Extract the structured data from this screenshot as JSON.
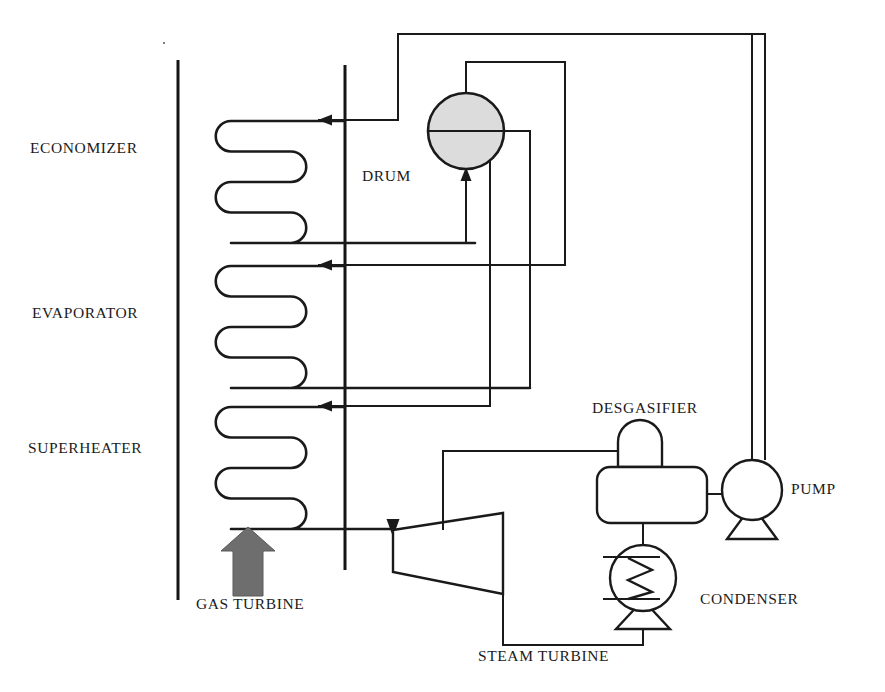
{
  "diagram": {
    "type": "process-flow-schematic",
    "canvas": {
      "width": 885,
      "height": 692
    },
    "colors": {
      "line": "#1a1a1a",
      "drum_fill": "#dcdcdc",
      "gas_arrow": "#6e6e6e",
      "background": "#ffffff",
      "text": "#1b1b1b"
    }
  },
  "labels": {
    "economizer": "ECONOMIZER",
    "evaporator": "EVAPORATOR",
    "superheater": "SUPERHEATER",
    "drum": "DRUM",
    "desgasifier": "DESGASIFIER",
    "pump": "PUMP",
    "condenser": "CONDENSER",
    "gas_turbine": "GAS TURBINE",
    "steam_turbine": "STEAM TURBINE"
  },
  "label_positions": {
    "economizer": {
      "x": 30,
      "y": 147
    },
    "evaporator": {
      "x": 32,
      "y": 305
    },
    "superheater": {
      "x": 28,
      "y": 440
    },
    "drum": {
      "x": 362,
      "y": 168
    },
    "desgasifier": {
      "x": 592,
      "y": 401
    },
    "pump": {
      "x": 792,
      "y": 481
    },
    "condenser": {
      "x": 700,
      "y": 592
    },
    "gas_turbine": {
      "x": 196,
      "y": 596
    },
    "steam_turbine": {
      "x": 478,
      "y": 648
    }
  },
  "components": {
    "hrsg_boundary": {
      "name": "HRSG casing boundary",
      "left_wall_x": 178,
      "gas_duct_x": 345,
      "top_y": 60,
      "bottom_y": 600
    },
    "coils": [
      {
        "section": "economizer",
        "passes": 4,
        "left_x": 216,
        "right_x": 306,
        "top_y": 121,
        "pitch": 30.5
      },
      {
        "section": "evaporator",
        "passes": 4,
        "left_x": 216,
        "right_x": 306,
        "top_y": 266,
        "pitch": 30.5
      },
      {
        "section": "superheater",
        "passes": 4,
        "left_x": 216,
        "right_x": 306,
        "top_y": 407,
        "pitch": 30.5
      }
    ],
    "steam_drum": {
      "cx": 466,
      "cy": 131,
      "r": 38,
      "water_level_y": 131
    },
    "steam_turbine": {
      "inlet_top_left": {
        "x": 393,
        "y": 530
      },
      "outlet_bottom_right": {
        "x": 503,
        "y": 594
      },
      "shape": "trapezoid"
    },
    "desgasifier": {
      "x": 597,
      "y": 467,
      "width": 110,
      "height": 56,
      "dome_width": 44,
      "dome_height": 28
    },
    "feed_pump": {
      "cx": 752,
      "cy": 490,
      "r": 30,
      "base": "trapezoid"
    },
    "condenser": {
      "cx": 643,
      "cy": 578,
      "r": 33,
      "base": "trapezoid",
      "internal": "zigzag-tube"
    },
    "gas_turbine_exhaust_arrow": {
      "x": 248,
      "y_tip": 527,
      "y_base": 596,
      "width": 30,
      "direction": "up"
    }
  },
  "flow_arrows": [
    {
      "name": "economizer-inlet",
      "x": 320,
      "y": 120,
      "direction": "left"
    },
    {
      "name": "evaporator-inlet",
      "x": 320,
      "y": 265,
      "direction": "left"
    },
    {
      "name": "superheater-inlet",
      "x": 320,
      "y": 406,
      "direction": "left"
    },
    {
      "name": "drum-feed-riser",
      "x": 466,
      "y": 175,
      "direction": "up"
    },
    {
      "name": "turbine-steam-inlet",
      "x": 393,
      "y": 528,
      "direction": "down"
    }
  ],
  "flow_paths": [
    {
      "name": "pump-to-economizer",
      "note": "top header from pump discharge back to economizer inlet"
    },
    {
      "name": "economizer-outlet-to-drum",
      "note": "riser into drum bottom"
    },
    {
      "name": "drum-top-to-evaporator",
      "note": "downcomer loop to evaporator inlet"
    },
    {
      "name": "drum-side-to-superheater",
      "note": "saturated steam to superheater inlet"
    },
    {
      "name": "superheater-to-turbine",
      "note": "superheated steam to steam turbine inlet"
    },
    {
      "name": "turbine-exhaust-to-condenser",
      "note": "exhaust line to condenser"
    },
    {
      "name": "condenser-to-desgasifier",
      "note": "condensate up to desgasifier"
    },
    {
      "name": "desgasifier-to-pump",
      "note": "deaerated water to feed pump suction"
    },
    {
      "name": "desgasifier-extraction",
      "note": "turbine extraction steam to desgasifier"
    }
  ]
}
